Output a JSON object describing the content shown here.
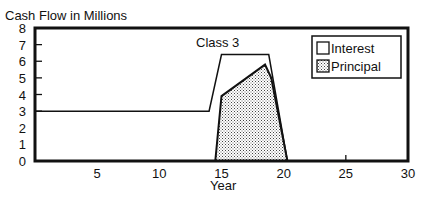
{
  "chart_data": {
    "type": "area",
    "title": "Cash Flow in Millions",
    "annotation": "Class 3",
    "xlabel": "Year",
    "ylabel": "Cash Flow in Millions",
    "xlim": [
      0,
      30
    ],
    "ylim": [
      0,
      8
    ],
    "x_ticks": [
      5,
      10,
      15,
      20,
      25,
      30
    ],
    "y_ticks": [
      0,
      1,
      2,
      3,
      4,
      5,
      6,
      7,
      8
    ],
    "grid": false,
    "legend_position": "upper right",
    "series": [
      {
        "name": "Interest",
        "style": "line, white fill",
        "points": [
          [
            0,
            3.0
          ],
          [
            14.0,
            3.0
          ],
          [
            15.0,
            6.4
          ],
          [
            18.8,
            6.4
          ],
          [
            20.3,
            0
          ]
        ]
      },
      {
        "name": "Principal",
        "style": "stippled fill",
        "points": [
          [
            14.5,
            0
          ],
          [
            15.0,
            3.9
          ],
          [
            18.5,
            5.8
          ],
          [
            19.0,
            5.0
          ],
          [
            20.3,
            0
          ]
        ]
      }
    ]
  },
  "legend": {
    "items": [
      {
        "label": "Interest"
      },
      {
        "label": "Principal"
      }
    ]
  },
  "colors": {
    "line": "#111111",
    "background": "#ffffff",
    "stipple": "#444444"
  }
}
